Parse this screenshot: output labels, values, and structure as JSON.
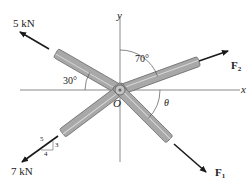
{
  "diagram": {
    "type": "force_system",
    "axes": {
      "x_label": "x",
      "y_label": "y",
      "origin_label": "O"
    },
    "forces": [
      {
        "id": "force_5kn",
        "label": "5 kN",
        "direction": "upper-left",
        "angle_note": "30° from negative x-axis"
      },
      {
        "id": "force_f2",
        "label": "F",
        "subscript": "2",
        "direction": "upper-right",
        "angle_note": "70° from y-axis"
      },
      {
        "id": "force_7kn",
        "label": "7 kN",
        "direction": "lower-left",
        "slope": {
          "hyp": "5",
          "rise": "3",
          "run": "4"
        }
      },
      {
        "id": "force_f1",
        "label": "F",
        "subscript": "1",
        "direction": "lower-right",
        "angle_note": "θ from x-axis"
      }
    ],
    "angles": {
      "a30": "30°",
      "a70": "70°",
      "theta": "θ"
    },
    "colors": {
      "member_fill": "#a8a8a8",
      "member_edge": "#6e6e6e",
      "member_highlight": "#d6d6d6",
      "axis": "#888888",
      "arrow": "#1a1a1a"
    }
  }
}
